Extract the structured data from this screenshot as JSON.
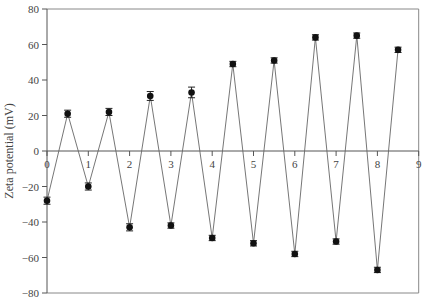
{
  "chart_data": {
    "type": "line",
    "title": "",
    "xlabel": "",
    "ylabel": "Zeta potential (mV)",
    "xlim": [
      0,
      9
    ],
    "ylim": [
      -80,
      80
    ],
    "x_ticks": [
      "0",
      "1",
      "2",
      "3",
      "4",
      "5",
      "6",
      "7",
      "8",
      "9"
    ],
    "y_ticks": [
      "80",
      "60",
      "40",
      "20",
      "0",
      "-20",
      "-40",
      "-60",
      "-80"
    ],
    "grid": false,
    "legend": null,
    "markers": "filled-circle-with-error-bars",
    "series": [
      {
        "name": "Zeta potential",
        "x": [
          0,
          0.5,
          1,
          1.5,
          2,
          2.5,
          3,
          3.5,
          4,
          4.5,
          5,
          5.5,
          6,
          6.5,
          7,
          7.5,
          8,
          8.5
        ],
        "values": [
          -28,
          21,
          -20,
          22,
          -43,
          31,
          -42,
          33,
          -49,
          49,
          -52,
          51,
          -58,
          64,
          -51,
          65,
          -67,
          57
        ],
        "error": [
          2,
          2,
          2,
          2,
          2,
          2.5,
          1.5,
          3,
          1.5,
          1.5,
          1.5,
          1.5,
          1.5,
          1.5,
          1.5,
          1.5,
          1.5,
          1.5
        ]
      }
    ],
    "colors": {
      "line": "#666666",
      "marker": "#111111",
      "axis": "#555555",
      "text": "#444444"
    }
  }
}
